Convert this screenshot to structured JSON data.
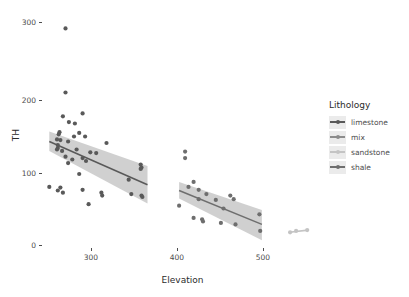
{
  "chart_data": {
    "type": "scatter",
    "title": "",
    "xlabel": "Elevation",
    "ylabel": "TH",
    "xlim": [
      238,
      560
    ],
    "ylim": [
      -12,
      310
    ],
    "xticks": [
      300,
      400,
      500
    ],
    "yticks": [
      0,
      100,
      200,
      300
    ],
    "grid": false,
    "legend": {
      "title": "Lithology",
      "position": "right",
      "entries": [
        {
          "label": "limestone",
          "color": "#595959"
        },
        {
          "label": "mix",
          "color": "#8c8c8c"
        },
        {
          "label": "sandstone",
          "color": "#c4c4c4"
        },
        {
          "label": "shale",
          "color": "#6e6e6e"
        }
      ]
    },
    "series": [
      {
        "name": "limestone",
        "color": "#595959",
        "points": [
          [
            262,
            290
          ],
          [
            262,
            201
          ],
          [
            259,
            168
          ],
          [
            282,
            172
          ],
          [
            266,
            160
          ],
          [
            273,
            158
          ],
          [
            255,
            146
          ],
          [
            254,
            143
          ],
          [
            278,
            145
          ],
          [
            272,
            140
          ],
          [
            285,
            140
          ],
          [
            252,
            136
          ],
          [
            256,
            135
          ],
          [
            265,
            133
          ],
          [
            310,
            131
          ],
          [
            253,
            128
          ],
          [
            253,
            124
          ],
          [
            252,
            122
          ],
          [
            258,
            120
          ],
          [
            275,
            122
          ],
          [
            291,
            118
          ],
          [
            298,
            117
          ],
          [
            262,
            112
          ],
          [
            282,
            110
          ],
          [
            270,
            108
          ],
          [
            286,
            106
          ],
          [
            265,
            103
          ],
          [
            350,
            101
          ],
          [
            351,
            97
          ],
          [
            350,
            95
          ],
          [
            278,
            88
          ],
          [
            336,
            80
          ],
          [
            243,
            70
          ],
          [
            256,
            69
          ],
          [
            253,
            65
          ],
          [
            282,
            66
          ],
          [
            259,
            62
          ],
          [
            304,
            62
          ],
          [
            305,
            58
          ],
          [
            339,
            60
          ],
          [
            351,
            58
          ],
          [
            352,
            56
          ],
          [
            289,
            46
          ]
        ],
        "fit": {
          "x0": 243,
          "y0": 133,
          "x1": 358,
          "y1": 73
        },
        "band": {
          "x0": 243,
          "lo0": 120,
          "hi0": 147,
          "x1": 358,
          "lo1": 47,
          "hi1": 99
        }
      },
      {
        "name": "shale",
        "color": "#6e6e6e",
        "points": [
          [
            402,
            119
          ],
          [
            402,
            110
          ],
          [
            412,
            77
          ],
          [
            406,
            70
          ],
          [
            418,
            66
          ],
          [
            427,
            60
          ],
          [
            418,
            53
          ],
          [
            438,
            52
          ],
          [
            455,
            58
          ],
          [
            459,
            53
          ],
          [
            395,
            44
          ],
          [
            447,
            40
          ],
          [
            489,
            32
          ],
          [
            412,
            27
          ],
          [
            422,
            25
          ],
          [
            423,
            22
          ],
          [
            444,
            20
          ],
          [
            461,
            18
          ],
          [
            490,
            9
          ]
        ],
        "fit": {
          "x0": 395,
          "y0": 65,
          "x1": 492,
          "y1": 18
        },
        "band": {
          "x0": 395,
          "lo0": 54,
          "hi0": 77,
          "x1": 492,
          "lo1": -4,
          "hi1": 38
        }
      },
      {
        "name": "sandstone",
        "color": "#c4c4c4",
        "points": [
          [
            525,
            7
          ],
          [
            532,
            9
          ],
          [
            545,
            10
          ]
        ],
        "fit": {
          "x0": 524,
          "y0": 7,
          "x1": 546,
          "y1": 10
        },
        "band": null
      },
      {
        "name": "mix",
        "color": "#8c8c8c",
        "points": [],
        "fit": null,
        "band": null
      }
    ]
  },
  "axis": {
    "yticks": [
      {
        "value": "300"
      },
      {
        "value": "200"
      },
      {
        "value": "100"
      },
      {
        "value": "0"
      }
    ],
    "xticks": [
      {
        "value": "300"
      },
      {
        "value": "400"
      },
      {
        "value": "500"
      }
    ]
  }
}
